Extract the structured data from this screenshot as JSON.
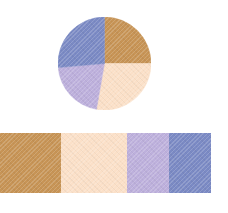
{
  "canvas": {
    "width": 228,
    "height": 213,
    "background": "#ffffff"
  },
  "palette": {
    "name": "four-color-palette",
    "colors": [
      {
        "name": "camel-tan",
        "hex": "#c79456"
      },
      {
        "name": "cream-peach",
        "hex": "#fbe0c8"
      },
      {
        "name": "light-violet",
        "hex": "#bdb0dc"
      },
      {
        "name": "slate-blue",
        "hex": "#7b8ac4"
      }
    ]
  },
  "chart_data": {
    "type": "pie",
    "title": "",
    "subtitle": "",
    "xlabel": "",
    "ylabel": "",
    "legend_position": "none",
    "grid": false,
    "start_angle_deg": 0,
    "direction": "clockwise",
    "center_px": [
      104,
      63
    ],
    "radius_px": 46,
    "labels": [
      "camel-tan",
      "cream-peach",
      "light-violet",
      "slate-blue"
    ],
    "colors": [
      "#c79456",
      "#fbe0c8",
      "#bdb0dc",
      "#7b8ac4"
    ],
    "angles_deg": [
      90,
      100,
      75,
      95
    ],
    "values": [
      25.0,
      27.8,
      20.8,
      26.4
    ],
    "texture": "diagonal-hatch"
  },
  "swatch_bar": {
    "name": "color-swatch-bar",
    "x": 0,
    "y": 133,
    "width": 211,
    "height": 60,
    "texture": "diagonal-hatch",
    "swatches": [
      {
        "name": "swatch-camel-tan",
        "hex": "#c79456",
        "width": 61
      },
      {
        "name": "swatch-cream-peach",
        "hex": "#fbe0c8",
        "width": 66
      },
      {
        "name": "swatch-light-violet",
        "hex": "#bdb0dc",
        "width": 42
      },
      {
        "name": "swatch-slate-blue",
        "hex": "#7b8ac4",
        "width": 42
      }
    ]
  }
}
